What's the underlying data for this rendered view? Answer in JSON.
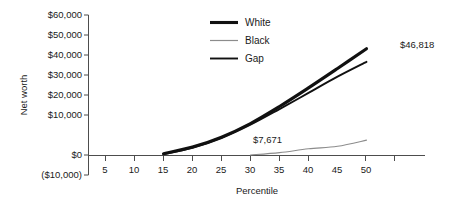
{
  "chart_data": {
    "type": "line",
    "title": "",
    "xlabel": "Percentile",
    "ylabel": "Net worth",
    "grid": false,
    "legend_position": "top-center",
    "xlim": [
      0,
      55
    ],
    "ylim": [
      -10000,
      60000
    ],
    "x_ticks": [
      5,
      10,
      15,
      20,
      25,
      30,
      35,
      40,
      45,
      50
    ],
    "x_tick_labels": [
      "5",
      "10",
      "15",
      "20",
      "25",
      "30",
      "35",
      "40",
      "45",
      "50"
    ],
    "y_ticks": [
      -10000,
      0,
      10000,
      20000,
      30000,
      40000,
      50000,
      60000
    ],
    "y_tick_labels": [
      "($10,000)",
      "$0",
      "$10,000",
      "$20,000",
      "$30,000",
      "$40,000",
      "$50,000",
      "$60,000"
    ],
    "series": [
      {
        "name": "White",
        "color": "#111111",
        "width": 3.1,
        "x": [
          15,
          20,
          25,
          30,
          35,
          40,
          45,
          50
        ],
        "values": [
          900,
          4200,
          9200,
          16000,
          24500,
          33800,
          43500,
          53400
        ]
      },
      {
        "name": "Black",
        "color": "#8c8c8c",
        "width": 1.1,
        "x": [
          30,
          35,
          40,
          45,
          50
        ],
        "values": [
          250,
          1450,
          3350,
          4600,
          7671
        ]
      },
      {
        "name": "Gap",
        "color": "#111111",
        "width": 1.9,
        "x": [
          15,
          20,
          25,
          30,
          35,
          40,
          45,
          50
        ],
        "values": [
          700,
          3800,
          8700,
          15400,
          23200,
          31300,
          39400,
          46818
        ]
      }
    ],
    "annotations": [
      {
        "text": "$46,818",
        "x": 50,
        "y": 46818,
        "dx": 10,
        "dy": 1
      },
      {
        "text": "$7,671",
        "x": 30,
        "y": 7671,
        "dx": 2,
        "dy": -1
      }
    ]
  },
  "legend": {
    "items": [
      {
        "label": "White"
      },
      {
        "label": "Black"
      },
      {
        "label": "Gap"
      }
    ]
  },
  "axes": {
    "x_title": "Percentile",
    "y_title": "Net worth"
  },
  "y_labels": {
    "t0": "$60,000",
    "t1": "$50,000",
    "t2": "$40,000",
    "t3": "$30,000",
    "t4": "$20,000",
    "t5": "$10,000",
    "t6": "$0",
    "t7": "($10,000)"
  },
  "x_labels": {
    "t0": "5",
    "t1": "10",
    "t2": "15",
    "t3": "20",
    "t4": "25",
    "t5": "30",
    "t6": "35",
    "t7": "40",
    "t8": "45",
    "t9": "50"
  },
  "annotation_labels": {
    "a0": "$46,818",
    "a1": "$7,671"
  }
}
